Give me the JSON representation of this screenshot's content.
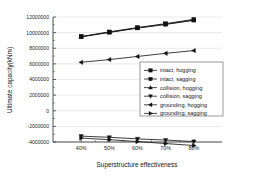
{
  "chart_data": {
    "type": "line",
    "title": "",
    "xlabel": "Superstructure effectiveness",
    "ylabel": "Ultimate capacity(kNm)",
    "categories": [
      "40%",
      "50%",
      "60%",
      "70%",
      "80%"
    ],
    "x_tick_labels": [
      "40%",
      "50%",
      "60%",
      "70%",
      "80%"
    ],
    "y_tick_labels": [
      "12000000",
      "10000000",
      "8000000",
      "6000000",
      "4000000",
      "2000000",
      "0",
      "-2000000",
      "-4000000"
    ],
    "y_tick_values": [
      12000000,
      10000000,
      8000000,
      6000000,
      4000000,
      2000000,
      0,
      -2000000,
      -4000000
    ],
    "ylim": [
      -4000000,
      12000000
    ],
    "grid": true,
    "legend_position": "center-right",
    "series": [
      {
        "name": "intact, hogging",
        "marker": "square",
        "values": [
          9500000,
          10100000,
          10650000,
          11150000,
          11700000
        ]
      },
      {
        "name": "intact, sagging",
        "marker": "square-filled",
        "values": [
          9480000,
          10050000,
          10600000,
          11080000,
          11600000
        ]
      },
      {
        "name": "collision, hogging",
        "marker": "triangle-up",
        "values": [
          9450000,
          10020000,
          10580000,
          11050000,
          11580000
        ]
      },
      {
        "name": "collision, sagging",
        "marker": "triangle-down",
        "values": [
          -3250000,
          -3400000,
          -3600000,
          -3750000,
          -3950000
        ]
      },
      {
        "name": "grounding, hogging",
        "marker": "triangle-left",
        "values": [
          6200000,
          6550000,
          6950000,
          7350000,
          7700000
        ]
      },
      {
        "name": "grounding, sagging",
        "marker": "triangle-right",
        "values": [
          -3500000,
          -3700000,
          -3950000,
          -4200000,
          -4450000
        ]
      }
    ]
  },
  "legend": {
    "entries": [
      "intact, hogging",
      "intact, sagging",
      "collision, hogging",
      "collision, sagging",
      "grounding, hogging",
      "grounding, sagging"
    ]
  },
  "colors": {
    "axis": "#3c3c3c",
    "grid": "#d2d2d2",
    "series": "#1a1a1a",
    "background": "#ffffff"
  }
}
